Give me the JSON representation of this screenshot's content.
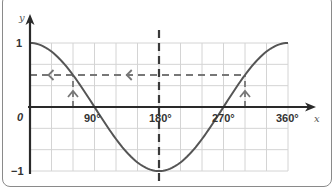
{
  "chart_data": {
    "type": "line",
    "title": "",
    "xlabel": "x",
    "ylabel": "y",
    "x_ticks": [
      "0",
      "90°",
      "180°",
      "270°",
      "360°"
    ],
    "y_ticks": [
      "1",
      "-1"
    ],
    "xlim": [
      0,
      360
    ],
    "ylim": [
      -1,
      1
    ],
    "grid": true,
    "grid_step_x_deg": 30,
    "grid_step_y": 0.3333,
    "series": [
      {
        "name": "y = cos x",
        "x": [
          0,
          30,
          60,
          90,
          120,
          150,
          180,
          210,
          240,
          270,
          300,
          330,
          360
        ],
        "values": [
          1,
          0.866,
          0.5,
          0,
          -0.5,
          -0.866,
          -1,
          -0.866,
          -0.5,
          0,
          0.5,
          0.866,
          1
        ]
      }
    ],
    "annotations": [
      {
        "type": "dashed-horizontal-line",
        "y": 0.5,
        "from_x": 0,
        "to_x": 300,
        "arrows": "pointing left"
      },
      {
        "type": "dashed-vertical-line",
        "x": 180,
        "label": "line of symmetry"
      },
      {
        "type": "dashed-vertical-arrow",
        "x": 60,
        "from_y": 0,
        "to_y": 0.5,
        "direction": "up"
      },
      {
        "type": "dashed-vertical-arrow",
        "x": 300,
        "from_y": 0,
        "to_y": 0.5,
        "direction": "up"
      }
    ]
  },
  "labels": {
    "y_axis": "y",
    "x_axis": "x",
    "origin": "0",
    "y_one": "1",
    "y_minus_one": "−1",
    "x_90": "90°",
    "x_180": "180°",
    "x_270": "270°",
    "x_360": "360°"
  },
  "colors": {
    "curve": "#555555",
    "axis": "#2a2a2a",
    "grid": "#d4d4d4",
    "dashed": "#777777"
  }
}
